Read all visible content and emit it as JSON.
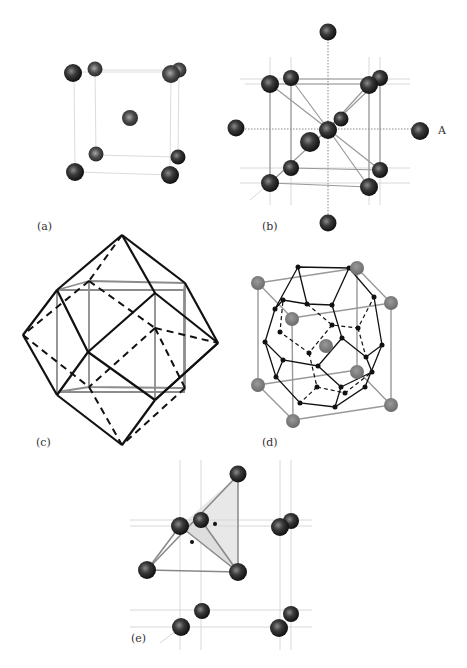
{
  "figure": {
    "panels": [
      {
        "id": "a",
        "label": "(a)",
        "description": "body-centered cubic unit cell"
      },
      {
        "id": "b",
        "label": "(b)",
        "description": "bcc cell with neighboring atoms and octahedral/tetrahedral links",
        "atom_label": "A"
      },
      {
        "id": "c",
        "label": "(c)",
        "description": "rhombic dodecahedron around cube"
      },
      {
        "id": "d",
        "label": "(d)",
        "description": "truncated octahedron (Wigner-Seitz cell) in bcc cube"
      },
      {
        "id": "e",
        "label": "(e)",
        "description": "tetrahedral interstitial site"
      }
    ]
  },
  "colors": {
    "atom_dark": "#2a2a2a",
    "atom_mid": "#555555",
    "atom_gray": "#7a7a7a",
    "line_light": "#d0d0d0",
    "line_gray": "#999999",
    "line_black": "#111111"
  }
}
